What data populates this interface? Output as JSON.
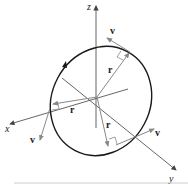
{
  "figure": {
    "type": "3d-vector-diagram",
    "colors": {
      "axis": "#555555",
      "vector": "#8a8a8a",
      "orbit": "#1a1a1a",
      "text": "#222222",
      "rule": "#cccccc"
    }
  },
  "axes": {
    "x_label": "x",
    "y_label": "y",
    "z_label": "z"
  },
  "vectors": {
    "top": {
      "r_label": "r",
      "v_label": "v"
    },
    "left": {
      "r_label": "r",
      "v_label": "v"
    },
    "bottom": {
      "r_label": "r",
      "v_label": "v"
    }
  }
}
